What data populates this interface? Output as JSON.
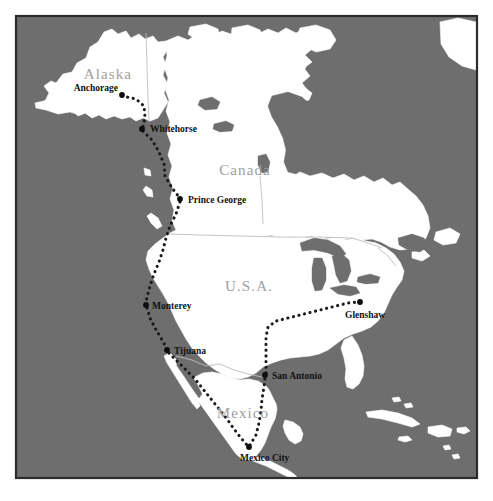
{
  "map": {
    "title": "North America Route Map",
    "frame": {
      "x": 16,
      "y": 16,
      "width": 461,
      "height": 462,
      "border_color": "#2b2b2b"
    },
    "colors": {
      "ocean": "#6e6e6e",
      "land": "#ffffff",
      "country_label": "#9e9e9e",
      "city_label": "#111111",
      "route": "#1a1a1a",
      "border_line": "#bdbdbd",
      "page_background": "#ffffff"
    },
    "country_labels": [
      {
        "name": "Alaska",
        "text": "Alaska",
        "x": 108,
        "y": 79,
        "font_size": 15
      },
      {
        "name": "Canada",
        "text": "Canada",
        "x": 245,
        "y": 175,
        "font_size": 16
      },
      {
        "name": "U.S.A.",
        "text": "U.S.A.",
        "x": 249,
        "y": 291,
        "font_size": 16
      },
      {
        "name": "Mexico",
        "text": "Mexico",
        "x": 243,
        "y": 418,
        "font_size": 14
      }
    ],
    "cities": [
      {
        "name": "Anchorage",
        "label": "Anchorage",
        "dot_x": 122,
        "dot_y": 95,
        "label_x": 118,
        "label_y": 91,
        "anchor": "end",
        "baseline": "baseline"
      },
      {
        "name": "Whitehorse",
        "label": "Whitehorse",
        "dot_x": 142,
        "dot_y": 129,
        "label_x": 150,
        "label_y": 132,
        "anchor": "start",
        "baseline": "baseline"
      },
      {
        "name": "Prince George",
        "label": "Prince George",
        "dot_x": 180,
        "dot_y": 199,
        "label_x": 188,
        "label_y": 203,
        "anchor": "start",
        "baseline": "baseline"
      },
      {
        "name": "Monterey",
        "label": "Monterey",
        "dot_x": 146,
        "dot_y": 305,
        "label_x": 152,
        "label_y": 309,
        "anchor": "start",
        "baseline": "baseline"
      },
      {
        "name": "Tijuana",
        "label": "Tijuana",
        "dot_x": 167,
        "dot_y": 350,
        "label_x": 174,
        "label_y": 354,
        "anchor": "start",
        "baseline": "baseline"
      },
      {
        "name": "San Antonio",
        "label": "San Antonio",
        "dot_x": 265,
        "dot_y": 375,
        "label_x": 272,
        "label_y": 379,
        "anchor": "start",
        "baseline": "baseline"
      },
      {
        "name": "Glenshaw",
        "label": "Glenshaw",
        "dot_x": 360,
        "dot_y": 302,
        "label_x": 345,
        "label_y": 318,
        "anchor": "start",
        "baseline": "baseline"
      },
      {
        "name": "Mexico City",
        "label": "Mexico City",
        "dot_x": 249,
        "dot_y": 447,
        "label_x": 240,
        "label_y": 461,
        "anchor": "start",
        "baseline": "baseline"
      }
    ],
    "route": {
      "style": "dotted",
      "dot_radius": 2.1,
      "segments": [
        {
          "from": "Anchorage",
          "to": "Whitehorse"
        },
        {
          "from": "Whitehorse",
          "to": "Prince George"
        },
        {
          "from": "Prince George",
          "to": "Monterey"
        },
        {
          "from": "Monterey",
          "to": "Tijuana"
        },
        {
          "from": "Tijuana",
          "to": "Mexico City"
        },
        {
          "from": "Mexico City",
          "to": "San Antonio"
        },
        {
          "from": "San Antonio",
          "to": "Glenshaw"
        }
      ]
    }
  }
}
